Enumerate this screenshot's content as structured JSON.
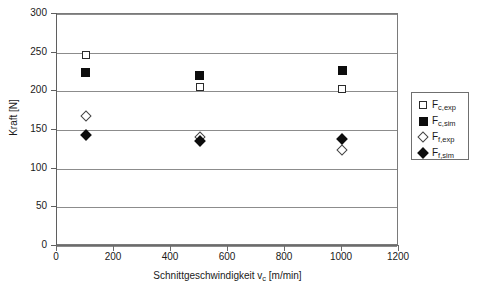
{
  "chart_data": {
    "type": "scatter",
    "title": "",
    "xlabel": "Schnittgeschwindigkeit v_c [m/min]",
    "xlabel_main": "Schnittgeschwindigkeit v",
    "xlabel_sub": "c",
    "xlabel_unit": " [m/min]",
    "ylabel": "Kraft [N]",
    "xlim": [
      0,
      1200
    ],
    "ylim": [
      0,
      300
    ],
    "xticks": [
      0,
      200,
      400,
      600,
      800,
      1000,
      1200
    ],
    "yticks": [
      0,
      50,
      100,
      150,
      200,
      250,
      300
    ],
    "grid": "horizontal",
    "legend_position": "right",
    "x": [
      100,
      500,
      1000
    ],
    "series": [
      {
        "name": "F_c,exp",
        "label_main": "F",
        "label_sub": "c,exp",
        "marker": "open-square",
        "color": "#000000",
        "values": [
          247,
          205,
          203
        ]
      },
      {
        "name": "F_c,sim",
        "label_main": "F",
        "label_sub": "c,sim",
        "marker": "filled-square",
        "color": "#000000",
        "values": [
          225,
          220,
          227
        ]
      },
      {
        "name": "F_f,exp",
        "label_main": "F",
        "label_sub": "f,exp",
        "marker": "open-diamond",
        "color": "#000000",
        "values": [
          168,
          141,
          124
        ]
      },
      {
        "name": "F_f,sim",
        "label_main": "F",
        "label_sub": "f,sim",
        "marker": "filled-diamond",
        "color": "#000000",
        "values": [
          143,
          136,
          139
        ]
      }
    ]
  },
  "axis": {
    "y_tick_labels": [
      "300",
      "250",
      "200",
      "150",
      "100",
      "50",
      "0"
    ],
    "x_tick_labels": [
      "0",
      "200",
      "400",
      "600",
      "800",
      "1000",
      "1200"
    ],
    "y_title": "Kraft [N]"
  },
  "legend": {
    "items": [
      {
        "label_main": "F",
        "label_sub": "c,exp",
        "marker": "open-square"
      },
      {
        "label_main": "F",
        "label_sub": "c,sim",
        "marker": "filled-square"
      },
      {
        "label_main": "F",
        "label_sub": "f,exp",
        "marker": "open-diamond"
      },
      {
        "label_main": "F",
        "label_sub": "f,sim",
        "marker": "filled-diamond"
      }
    ]
  }
}
